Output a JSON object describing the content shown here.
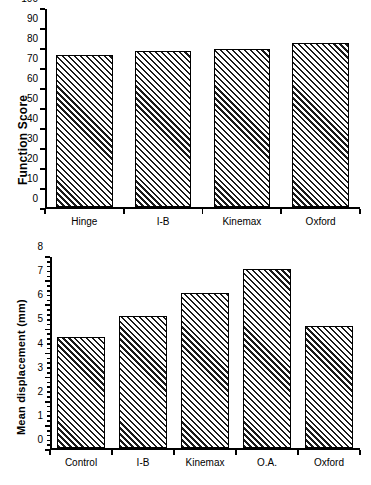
{
  "figure": {
    "background": "#ffffff",
    "bar_edge_color": "#000000",
    "bar_fill": "diagonal-hatch"
  },
  "chart_data": [
    {
      "id": "function-score",
      "type": "bar",
      "title": "",
      "xlabel": "",
      "ylabel": "Function Score",
      "categories": [
        "Hinge",
        "I-B",
        "Kinemax",
        "Oxford"
      ],
      "values": [
        77,
        79,
        80,
        83
      ],
      "ylim": [
        0,
        100
      ],
      "ytick_step": 10,
      "yticks": [
        0,
        10,
        20,
        30,
        40,
        50,
        60,
        70,
        80,
        90,
        100
      ],
      "ytick_labels": [
        "0",
        "10",
        "20",
        "30",
        "40",
        "50",
        "60",
        "70",
        "80",
        "90",
        "100"
      ],
      "minor_ticks": false,
      "grid": false,
      "legend": null
    },
    {
      "id": "mean-displacement",
      "type": "bar",
      "title": "",
      "xlabel": "",
      "ylabel": "Mean displacement (mm)",
      "categories": [
        "Control",
        "I-B",
        "Kinemax",
        "O.A.",
        "Oxford"
      ],
      "values": [
        4.65,
        5.55,
        6.5,
        7.5,
        5.1
      ],
      "ylim": [
        0,
        8
      ],
      "ytick_step": 1,
      "yticks": [
        0,
        1,
        2,
        3,
        4,
        5,
        6,
        7,
        8
      ],
      "ytick_labels": [
        "0",
        "1",
        "2",
        "3",
        "4",
        "5",
        "6",
        "7",
        "8"
      ],
      "minor_ticks": true,
      "minor_per_major": 5,
      "grid": false,
      "legend": null
    }
  ]
}
